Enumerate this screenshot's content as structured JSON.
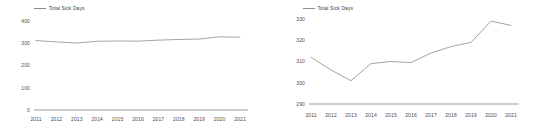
{
  "figure": {
    "background_color": "#ffffff",
    "line_color": "#8c8c8c",
    "axis_color": "#6e6e6e",
    "text_color": "#4a4a4a"
  },
  "panels": [
    {
      "name": "left-panel",
      "legend_label": "Total Sick Days",
      "ytick_labels": [
        "400",
        "300",
        "200",
        "100",
        "0"
      ],
      "xtick_labels": [
        "2011",
        "2012",
        "2013",
        "2014",
        "2015",
        "2016",
        "2017",
        "2018",
        "2019",
        "2020",
        "2021"
      ]
    },
    {
      "name": "right-panel",
      "legend_label": "Total Sick Days",
      "ytick_labels": [
        "330",
        "320",
        "310",
        "300",
        "290"
      ],
      "xtick_labels": [
        "2011",
        "2012",
        "2013",
        "2014",
        "2015",
        "2016",
        "2017",
        "2018",
        "2019",
        "2020",
        "2021"
      ]
    }
  ],
  "chart_data": [
    {
      "type": "line",
      "title": "",
      "xlabel": "",
      "ylabel": "",
      "grid": false,
      "legend_position": "top-left",
      "series": [
        {
          "name": "Total Sick Days",
          "values": [
            312,
            306,
            301,
            309,
            310,
            309.5,
            314,
            317,
            319,
            329,
            327
          ]
        }
      ],
      "categories": [
        "2011",
        "2012",
        "2013",
        "2014",
        "2015",
        "2016",
        "2017",
        "2018",
        "2019",
        "2020",
        "2021"
      ],
      "ylim": [
        0,
        400
      ],
      "yticks": [
        0,
        100,
        200,
        300,
        400
      ]
    },
    {
      "type": "line",
      "title": "",
      "xlabel": "",
      "ylabel": "",
      "grid": false,
      "legend_position": "top-left",
      "series": [
        {
          "name": "Total Sick Days",
          "values": [
            312,
            306,
            301,
            309,
            310,
            309.5,
            314,
            317,
            319,
            329,
            327
          ]
        }
      ],
      "categories": [
        "2011",
        "2012",
        "2013",
        "2014",
        "2015",
        "2016",
        "2017",
        "2018",
        "2019",
        "2020",
        "2021"
      ],
      "ylim": [
        290,
        330
      ],
      "yticks": [
        290,
        300,
        310,
        320,
        330
      ]
    }
  ]
}
